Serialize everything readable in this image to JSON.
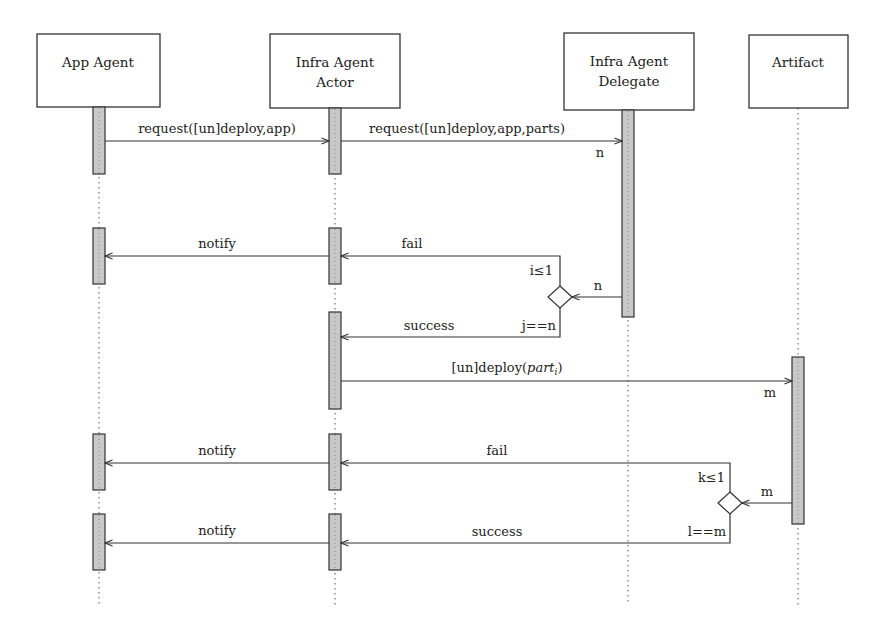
{
  "diagram": {
    "type": "sequence",
    "participants": [
      {
        "id": "app",
        "label_lines": [
          "App Agent"
        ],
        "x": 99
      },
      {
        "id": "actor",
        "label_lines": [
          "Infra Agent",
          "Actor"
        ],
        "x": 335
      },
      {
        "id": "delegate",
        "label_lines": [
          "Infra Agent",
          "Delegate"
        ],
        "x": 628
      },
      {
        "id": "artifact",
        "label_lines": [
          "Artifact"
        ],
        "x": 798
      }
    ],
    "messages": [
      {
        "from": "app",
        "to": "actor",
        "label": "request([un]deploy,app)"
      },
      {
        "from": "actor",
        "to": "delegate",
        "label": "request([un]deploy,app,parts)",
        "multiplicity": "n"
      },
      {
        "from": "delegate",
        "to": "decision1",
        "label": "n"
      },
      {
        "from": "decision1",
        "to": "actor",
        "label": "fail",
        "guard": "i≤1"
      },
      {
        "from": "actor",
        "to": "app",
        "label": "notify"
      },
      {
        "from": "decision1",
        "to": "actor",
        "label": "success",
        "guard": "j==n"
      },
      {
        "from": "actor",
        "to": "artifact",
        "label_prefix": "[un]deploy(",
        "label_italic": "part",
        "label_sub": "i",
        "label_suffix": ")",
        "multiplicity": "m"
      },
      {
        "from": "artifact",
        "to": "decision2",
        "label": "m"
      },
      {
        "from": "decision2",
        "to": "actor",
        "label": "fail",
        "guard": "k≤1"
      },
      {
        "from": "actor",
        "to": "app",
        "label": "notify"
      },
      {
        "from": "decision2",
        "to": "actor",
        "label": "success",
        "guard": "l==m"
      },
      {
        "from": "actor",
        "to": "app",
        "label": "notify"
      }
    ]
  },
  "labels": {
    "h_app": "App Agent",
    "h_actor_1": "Infra Agent",
    "h_actor_2": "Actor",
    "h_del_1": "Infra Agent",
    "h_del_2": "Delegate",
    "h_art": "Artifact",
    "m1": "request([un]deploy,app)",
    "m2": "request([un]deploy,app,parts)",
    "m2_mult": "n",
    "d1_in": "n",
    "fail1": "fail",
    "guard_i": "i≤1",
    "notify1": "notify",
    "success1": "success",
    "guard_j": "j==n",
    "m3_prefix": "[un]deploy(",
    "m3_italic": "part",
    "m3_sub": "i",
    "m3_suffix": ")",
    "m3_mult": "m",
    "d2_in": "m",
    "fail2": "fail",
    "guard_k": "k≤1",
    "notify2": "notify",
    "success2": "success",
    "guard_l": "l==m",
    "notify3": "notify"
  },
  "colors": {
    "line": "#333333",
    "activation_fill": "#c8c8c8",
    "background": "#ffffff"
  }
}
